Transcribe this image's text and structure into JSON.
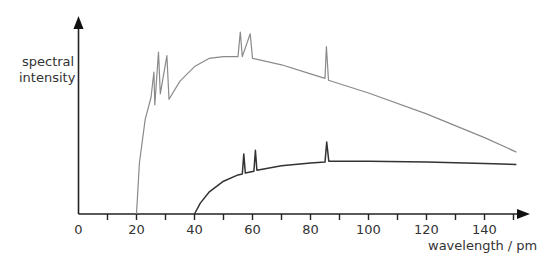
{
  "chart_data": {
    "type": "line",
    "title": "",
    "xlabel": "wavelength / pm",
    "ylabel": "spectral intensity",
    "xlim": [
      0,
      152
    ],
    "x_ticks_labeled": [
      0,
      20,
      40,
      60,
      80,
      100,
      120,
      140
    ],
    "x_ticks_minor": [
      10,
      30,
      50,
      70,
      90,
      110,
      130,
      150
    ],
    "y_ticks": [],
    "grid": false,
    "legend": null,
    "series": [
      {
        "name": "higher voltage spectrum",
        "color": "#8a8a8a",
        "cutoff_wavelength_pm": 20,
        "characteristic_peaks_pm": [
          26,
          28,
          31,
          56,
          59,
          86
        ],
        "points": [
          [
            20,
            0
          ],
          [
            21,
            0.28
          ],
          [
            23,
            0.52
          ],
          [
            25,
            0.64
          ],
          [
            26,
            0.78
          ],
          [
            26.3,
            0.6
          ],
          [
            27.6,
            0.89
          ],
          [
            28.2,
            0.66
          ],
          [
            30.5,
            0.87
          ],
          [
            31.2,
            0.63
          ],
          [
            35,
            0.73
          ],
          [
            40,
            0.81
          ],
          [
            45,
            0.855
          ],
          [
            50,
            0.865
          ],
          [
            55,
            0.865
          ],
          [
            55.8,
            1.0
          ],
          [
            56.5,
            0.865
          ],
          [
            59.2,
            0.99
          ],
          [
            60,
            0.855
          ],
          [
            70,
            0.82
          ],
          [
            80,
            0.77
          ],
          [
            85,
            0.745
          ],
          [
            85.5,
            0.92
          ],
          [
            86.2,
            0.735
          ],
          [
            100,
            0.665
          ],
          [
            120,
            0.55
          ],
          [
            140,
            0.42
          ],
          [
            151,
            0.34
          ]
        ]
      },
      {
        "name": "lower voltage spectrum",
        "color": "#333333",
        "cutoff_wavelength_pm": 40,
        "characteristic_peaks_pm": [
          57,
          61,
          86
        ],
        "points": [
          [
            40,
            0
          ],
          [
            42,
            0.06
          ],
          [
            45,
            0.12
          ],
          [
            50,
            0.18
          ],
          [
            55,
            0.215
          ],
          [
            56.5,
            0.22
          ],
          [
            57,
            0.33
          ],
          [
            57.5,
            0.225
          ],
          [
            60.5,
            0.235
          ],
          [
            61,
            0.35
          ],
          [
            61.5,
            0.24
          ],
          [
            70,
            0.265
          ],
          [
            80,
            0.28
          ],
          [
            85,
            0.285
          ],
          [
            85.6,
            0.395
          ],
          [
            86.3,
            0.29
          ],
          [
            100,
            0.29
          ],
          [
            120,
            0.285
          ],
          [
            140,
            0.278
          ],
          [
            151,
            0.272
          ]
        ]
      }
    ]
  },
  "axes": {
    "x_label": "wavelength / pm",
    "y_label_line1": "spectral",
    "y_label_line2": "intensity",
    "x_tick_labels": [
      "0",
      "20",
      "40",
      "60",
      "80",
      "100",
      "120",
      "140"
    ]
  }
}
